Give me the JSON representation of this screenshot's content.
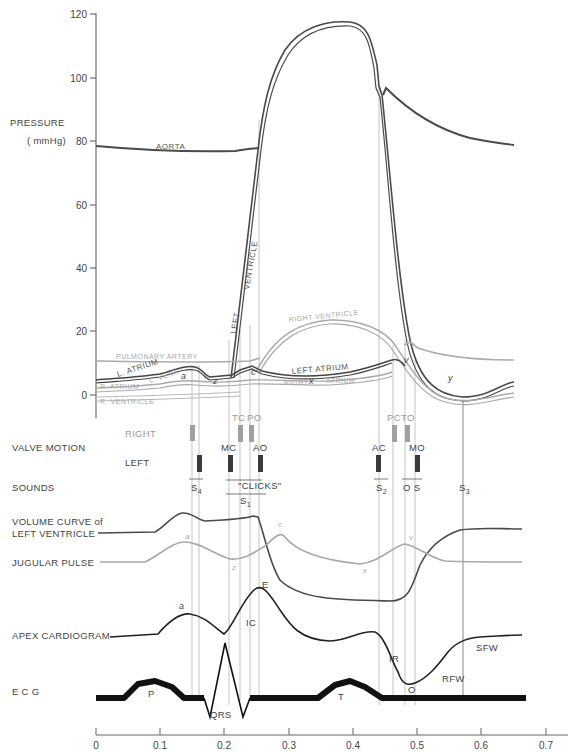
{
  "chart_data": {
    "type": "line",
    "xlabel": "Time (s)",
    "ylabel": "PRESSURE ( mmHg)",
    "xlim": [
      0,
      0.7
    ],
    "ylim": [
      0,
      120
    ],
    "x_ticks": [
      "0",
      "0.1",
      "0.2",
      "0.3",
      "0.4",
      "0.5",
      "0.6",
      "0.7"
    ],
    "y_ticks": [
      "0",
      "20",
      "40",
      "60",
      "80",
      "100",
      "120"
    ],
    "grid": false,
    "legend": "inline labels",
    "pressure_series": [
      {
        "name": "AORTA",
        "color": "#555555",
        "points": [
          [
            0,
            77.5
          ],
          [
            0.1,
            76
          ],
          [
            0.2,
            76
          ],
          [
            0.215,
            76.5
          ],
          [
            0.245,
            77
          ],
          [
            0.44,
            96
          ],
          [
            0.455,
            95
          ],
          [
            0.46,
            97.5
          ],
          [
            0.5,
            91
          ],
          [
            0.55,
            84
          ],
          [
            0.6,
            80
          ],
          [
            0.67,
            78
          ]
        ]
      },
      {
        "name": "LEFT VENTRICLE",
        "color": "#444444",
        "points": [
          [
            0,
            4.5
          ],
          [
            0.05,
            5
          ],
          [
            0.1,
            6.5
          ],
          [
            0.14,
            8.5
          ],
          [
            0.16,
            7
          ],
          [
            0.2,
            7
          ],
          [
            0.215,
            8
          ],
          [
            0.245,
            77
          ],
          [
            0.26,
            95
          ],
          [
            0.3,
            113
          ],
          [
            0.35,
            117
          ],
          [
            0.4,
            113
          ],
          [
            0.44,
            96
          ],
          [
            0.45,
            89
          ],
          [
            0.5,
            20
          ],
          [
            0.53,
            5
          ],
          [
            0.57,
            0
          ],
          [
            0.6,
            2
          ],
          [
            0.67,
            5
          ]
        ]
      },
      {
        "name": "LEFT ATRIUM",
        "color": "#444444",
        "points": [
          [
            0,
            4
          ],
          [
            0.1,
            6
          ],
          [
            0.14,
            8
          ],
          [
            0.16,
            6.5
          ],
          [
            0.2,
            7
          ],
          [
            0.225,
            10
          ],
          [
            0.26,
            8
          ],
          [
            0.35,
            10
          ],
          [
            0.46,
            14
          ],
          [
            0.49,
            14
          ],
          [
            0.52,
            5
          ],
          [
            0.57,
            0.5
          ],
          [
            0.67,
            4
          ]
        ]
      },
      {
        "name": "PULMONARY ARTERY",
        "color": "#aaaaaa",
        "points": [
          [
            0,
            11
          ],
          [
            0.1,
            10.5
          ],
          [
            0.2,
            10
          ],
          [
            0.245,
            11
          ],
          [
            0.3,
            22
          ],
          [
            0.35,
            24
          ],
          [
            0.4,
            22
          ],
          [
            0.46,
            17
          ],
          [
            0.48,
            18.5
          ],
          [
            0.5,
            16
          ],
          [
            0.55,
            12.5
          ],
          [
            0.67,
            11
          ]
        ]
      },
      {
        "name": "RIGHT VENTRICLE",
        "color": "#aaaaaa",
        "points": [
          [
            0,
            0
          ],
          [
            0.1,
            1
          ],
          [
            0.2,
            1.5
          ],
          [
            0.235,
            3
          ],
          [
            0.3,
            22
          ],
          [
            0.35,
            24
          ],
          [
            0.4,
            22
          ],
          [
            0.46,
            12
          ],
          [
            0.5,
            5
          ],
          [
            0.55,
            -1
          ],
          [
            0.6,
            0
          ],
          [
            0.67,
            1
          ]
        ]
      },
      {
        "name": "RIGHT ATRIUM",
        "color": "#aaaaaa",
        "points": [
          [
            0,
            2
          ],
          [
            0.1,
            3
          ],
          [
            0.14,
            4
          ],
          [
            0.16,
            3
          ],
          [
            0.2,
            3
          ],
          [
            0.25,
            5
          ],
          [
            0.3,
            5
          ],
          [
            0.4,
            7
          ],
          [
            0.48,
            11
          ],
          [
            0.5,
            8
          ],
          [
            0.55,
            0
          ],
          [
            0.6,
            1
          ],
          [
            0.67,
            2
          ]
        ]
      }
    ],
    "annotations": [
      "a",
      "z",
      "c",
      "x",
      "v",
      "y"
    ],
    "valve_events": {
      "right": [
        {
          "label": "TC",
          "t": 0.225
        },
        {
          "label": "PO",
          "t": 0.24
        },
        {
          "label": "PC",
          "t": 0.46
        },
        {
          "label": "TO",
          "t": 0.48
        }
      ],
      "left": [
        {
          "label": "MC",
          "t": 0.205
        },
        {
          "label": "AO",
          "t": 0.255
        },
        {
          "label": "AC",
          "t": 0.445
        },
        {
          "label": "MO",
          "t": 0.5
        }
      ]
    },
    "sounds": [
      "S4",
      "S1",
      "\"CLICKS\"",
      "S2",
      "O S",
      "S3"
    ],
    "ecg_labels": [
      "P",
      "QRS",
      "T"
    ],
    "apex_labels": [
      "a",
      "IC",
      "E",
      "IR",
      "O",
      "RFW",
      "SFW"
    ]
  },
  "labels": {
    "pressure": "PRESSURE",
    "unit": "( mmHg)",
    "aorta": "AORTA",
    "left": "LEFT",
    "ventricle": "VENTRICLE",
    "pulmonary_artery": "PULMONARY ARTERY",
    "right_ventricle_top": "RIGHT VENTRICLE",
    "left_atrium": "LEFT ATRIUM",
    "right_atrium_right": "RIGHT",
    "right_atrium_right2": "ATRIUM",
    "l_atrium": "L. ATRIUM",
    "l_vent": "L. VENT.",
    "r_atrium": "R. ATRIUM",
    "r_ventricle": "R. VENTRICLE",
    "a": "a",
    "z": "z",
    "c": "c",
    "x": "x",
    "v": "v",
    "y": "y",
    "valve_motion": "VALVE MOTION",
    "right": "RIGHT",
    "left_valve": "LEFT",
    "tc": "TC",
    "po": "PO",
    "mc": "MC",
    "ao": "AO",
    "pc": "PC",
    "to": "TO",
    "ac": "AC",
    "mo": "MO",
    "sounds": "SOUNDS",
    "s4": "S",
    "s4_sub": "4",
    "clicks": "\"CLICKS\"",
    "s1": "S",
    "s1_sub": "1",
    "s2": "S",
    "s2_sub": "2",
    "os": "O S",
    "s3": "S",
    "s3_sub": "3",
    "volume_1": "VOLUME CURVE of",
    "volume_2": "LEFT VENTRICLE",
    "jugular": "JUGULAR PULSE",
    "jug_a": "a",
    "jug_z": "z",
    "jug_c": "c",
    "jug_x": "x",
    "jug_v": "v",
    "apex": "APEX CARDIOGRAM",
    "apex_a": "a",
    "apex_ic": "IC",
    "apex_e": "E",
    "apex_ir": "IR",
    "apex_o": "O",
    "apex_rfw": "RFW",
    "apex_sfw": "SFW",
    "ecg": "E C G",
    "ecg_p": "P",
    "ecg_qrs": "QRS",
    "ecg_t": "T"
  },
  "y_ticks": [
    {
      "label": "120",
      "y": 14
    },
    {
      "label": "100",
      "y": 78
    },
    {
      "label": "80",
      "y": 141
    },
    {
      "label": "60",
      "y": 205
    },
    {
      "label": "40",
      "y": 268
    },
    {
      "label": "20",
      "y": 331
    },
    {
      "label": "0",
      "y": 395
    }
  ],
  "x_ticks": [
    {
      "label": "0",
      "x": 96
    },
    {
      "label": "0.1",
      "x": 160
    },
    {
      "label": "0.2",
      "x": 224
    },
    {
      "label": "0.3",
      "x": 289
    },
    {
      "label": "0.4",
      "x": 353
    },
    {
      "label": "0.5",
      "x": 417
    },
    {
      "label": "0.6",
      "x": 481
    },
    {
      "label": "0.7",
      "x": 546
    }
  ],
  "colors": {
    "dark": "#3c3c3c",
    "grey": "#a8a8a8",
    "guide": "#b0b0b0",
    "valve_dark": "#3a3a3a",
    "valve_light": "#a0a0a0"
  }
}
